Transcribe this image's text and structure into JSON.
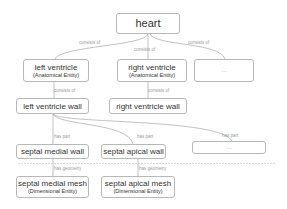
{
  "diagram": {
    "nodes": {
      "heart": {
        "label": "heart"
      },
      "left_ventricle": {
        "label": "left ventricle",
        "type": "(Anatomical Entity)"
      },
      "right_ventricle": {
        "label": "right ventricle",
        "type": "(Anatomical Entity)"
      },
      "more_1": {
        "label": "..."
      },
      "left_ventricle_wall": {
        "label": "left ventricle wall"
      },
      "right_ventricle_wall": {
        "label": "right ventricle wall"
      },
      "septal_medial_wall": {
        "label": "septal medial wall"
      },
      "septal_apical_wall": {
        "label": "septal apical wall"
      },
      "more_2": {
        "label": "..."
      },
      "septal_medial_mesh": {
        "label": "septal medial mesh",
        "type": "(Dimensional Entity)"
      },
      "septal_apical_mesh": {
        "label": "septal apical mesh",
        "type": "(Dimensional Entity)"
      }
    },
    "edge_labels": {
      "heart_left": "consists of",
      "heart_right": "consists of",
      "heart_more": "consists of",
      "lv_lvw": "consists of",
      "rv_rvw": "consists of",
      "lvw_smw": "has part",
      "lvw_saw": "has part",
      "lvw_more": "has part",
      "smw_smm": "has geometry",
      "saw_sam": "has geometry"
    },
    "colors": {
      "border": "#b8b8b8",
      "edge": "#a0a0a0",
      "edge_label": "#9a9a9a",
      "text": "#333333"
    }
  }
}
